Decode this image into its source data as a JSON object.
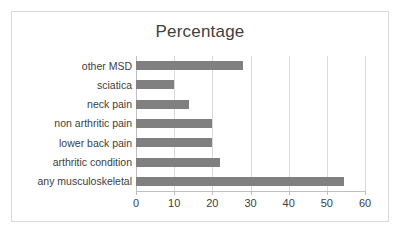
{
  "chart_data": {
    "type": "bar",
    "orientation": "horizontal",
    "title": "Percentage",
    "xlabel": "",
    "ylabel": "",
    "xlim": [
      0,
      60
    ],
    "xticks": [
      0,
      10,
      20,
      30,
      40,
      50,
      60
    ],
    "grid": true,
    "legend": null,
    "bar_color": "#808080",
    "categories": [
      "other MSD",
      "sciatica",
      "neck pain",
      "non arthritic pain",
      "lower back pain",
      "arthritic condition",
      "any musculoskeletal"
    ],
    "values": [
      28,
      10,
      14,
      20,
      20,
      22,
      54.5
    ]
  },
  "frame": {
    "border_color": "#d9d9d9",
    "background": "#ffffff"
  }
}
